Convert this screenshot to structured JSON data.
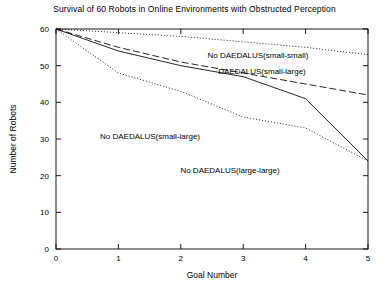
{
  "chart_data": {
    "type": "line",
    "title": "Survival of 60 Robots in Online Environments with Obstructed Perception",
    "xlabel": "Goal Number",
    "ylabel": "Number of Robots",
    "x": [
      0,
      1,
      2,
      3,
      4,
      5
    ],
    "xlim": [
      0,
      5
    ],
    "ylim": [
      0,
      60
    ],
    "xticks": [
      "0",
      "1",
      "2",
      "3",
      "4",
      "5"
    ],
    "yticks": [
      "0",
      "10",
      "20",
      "30",
      "40",
      "50",
      "60"
    ],
    "grid": false,
    "legend_position": "inline-annotations",
    "series": [
      {
        "name": "No DAEDALUS(small-small)",
        "style": "dotted",
        "values": [
          60,
          59,
          58,
          56.5,
          55,
          53
        ]
      },
      {
        "name": "DAEDALUS(small-large)",
        "style": "dashed",
        "values": [
          60,
          55,
          51,
          48,
          45,
          42
        ]
      },
      {
        "name": "No DAEDALUS(small-large)",
        "style": "dotted",
        "values": [
          60,
          48,
          43,
          36,
          33,
          24
        ]
      },
      {
        "name": "No DAEDALUS(large-large)",
        "style": "solid",
        "values": [
          60,
          54,
          50,
          47,
          41,
          24
        ]
      }
    ],
    "annotations": [
      {
        "text": "No DAEDALUS(small-small)",
        "x_px": 258,
        "y_px": 58
      },
      {
        "text": "DAEDALUS(small-large)",
        "x_px": 262,
        "y_px": 74
      },
      {
        "text": "No DAEDALUS(small-large)",
        "x_px": 150,
        "y_px": 139
      },
      {
        "text": "No DAEDALUS(large-large)",
        "x_px": 230,
        "y_px": 173
      }
    ]
  },
  "axes": {
    "line_color": "#000000",
    "plot_left_px": 56,
    "plot_right_px": 368,
    "plot_top_px": 29,
    "plot_bottom_px": 249
  }
}
